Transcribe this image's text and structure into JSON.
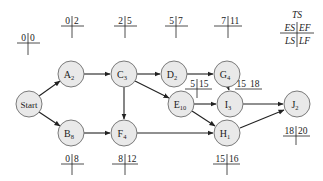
{
  "legend": {
    "top": "TS",
    "es": "ES",
    "ef": "EF",
    "ls": "LS",
    "lf": "LF"
  },
  "nodes": [
    {
      "id": "start",
      "letter": "Start",
      "sub": "",
      "x": 29,
      "y": 104
    },
    {
      "id": "A",
      "letter": "A",
      "sub": "2",
      "x": 71,
      "y": 74
    },
    {
      "id": "B",
      "letter": "B",
      "sub": "8",
      "x": 71,
      "y": 133
    },
    {
      "id": "C",
      "letter": "C",
      "sub": "3",
      "x": 124,
      "y": 74
    },
    {
      "id": "D",
      "letter": "D",
      "sub": "2",
      "x": 174,
      "y": 74
    },
    {
      "id": "E",
      "letter": "E",
      "sub": "10",
      "x": 181,
      "y": 104
    },
    {
      "id": "F",
      "letter": "F",
      "sub": "4",
      "x": 124,
      "y": 133
    },
    {
      "id": "G",
      "letter": "G",
      "sub": "4",
      "x": 227,
      "y": 74
    },
    {
      "id": "H",
      "letter": "H",
      "sub": "1",
      "x": 227,
      "y": 133
    },
    {
      "id": "I",
      "letter": "I",
      "sub": "3",
      "x": 230,
      "y": 104
    },
    {
      "id": "J",
      "letter": "J",
      "sub": "2",
      "x": 297,
      "y": 104
    }
  ],
  "times": {
    "start": {
      "es": "0",
      "ef": "0"
    },
    "A": {
      "es": "0",
      "ef": "2"
    },
    "B": {
      "es": "0",
      "ef": "8"
    },
    "C": {
      "es": "2",
      "ef": "5"
    },
    "D": {
      "es": "5",
      "ef": "7"
    },
    "E": {
      "es": "5",
      "ef": "15"
    },
    "F": {
      "es": "8",
      "ef": "12"
    },
    "G": {
      "es": "7",
      "ef": "11"
    },
    "H": {
      "es": "15",
      "ef": "16"
    },
    "I": {
      "es": "15",
      "ef": "18"
    },
    "J": {
      "es": "18",
      "ef": "20"
    }
  },
  "edges": [
    [
      "start",
      "A"
    ],
    [
      "start",
      "B"
    ],
    [
      "A",
      "C"
    ],
    [
      "B",
      "F"
    ],
    [
      "C",
      "D"
    ],
    [
      "C",
      "E"
    ],
    [
      "C",
      "F"
    ],
    [
      "D",
      "G"
    ],
    [
      "G",
      "I"
    ],
    [
      "E",
      "I"
    ],
    [
      "E",
      "H"
    ],
    [
      "F",
      "H"
    ],
    [
      "I",
      "J"
    ],
    [
      "H",
      "J"
    ]
  ]
}
